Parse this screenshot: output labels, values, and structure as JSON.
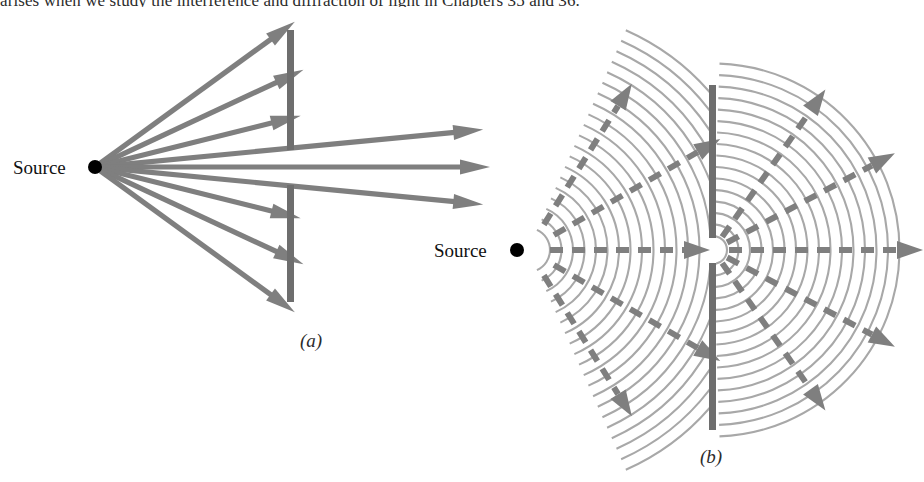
{
  "page": {
    "running_text": "arises when we study the interference and diffraction of light in Chapters 35 and 36.",
    "background_color": "#ffffff"
  },
  "colors": {
    "ray": "#7f7f7f",
    "barrier": "#6e6e6e",
    "wavefront": "#a8a8a8",
    "source_dot": "#000000",
    "text": "#111111",
    "caption": "#2b2b2b"
  },
  "figure": {
    "name": "huygens-ray-vs-wave-diffraction",
    "panels": [
      {
        "id": "a",
        "caption": "(a)",
        "caption_x": 300,
        "caption_y": 330,
        "model": "ray-model-straight-line-propagation",
        "source": {
          "label": "Source",
          "label_x": 13,
          "label_y": 157,
          "dot_x": 95,
          "dot_y": 167,
          "dot_r": 7
        },
        "barrier": {
          "x": 287,
          "width": 7,
          "upper_top": 30,
          "upper_bottom": 150,
          "lower_top": 185,
          "lower_bottom": 302,
          "slit_top": 150,
          "slit_bottom": 185
        },
        "rays": [
          {
            "name": "blocked-upper-1",
            "angle_deg": -36,
            "length": 247,
            "blocked": true
          },
          {
            "name": "blocked-upper-2",
            "angle_deg": -25,
            "length": 230,
            "blocked": true
          },
          {
            "name": "blocked-upper-3",
            "angle_deg": -14,
            "length": 212,
            "blocked": true
          },
          {
            "name": "through-slit-upper",
            "angle_deg": -5.5,
            "length": 390,
            "blocked": false
          },
          {
            "name": "through-slit-center",
            "angle_deg": 0,
            "length": 395,
            "blocked": false
          },
          {
            "name": "through-slit-lower",
            "angle_deg": 5.5,
            "length": 390,
            "blocked": false
          },
          {
            "name": "blocked-lower-1",
            "angle_deg": 14,
            "length": 212,
            "blocked": true
          },
          {
            "name": "blocked-lower-2",
            "angle_deg": 25,
            "length": 230,
            "blocked": true
          },
          {
            "name": "blocked-lower-3",
            "angle_deg": 36,
            "length": 247,
            "blocked": true
          }
        ]
      },
      {
        "id": "b",
        "caption": "(b)",
        "caption_x": 700,
        "caption_y": 446,
        "model": "wave-model-huygens-diffraction",
        "source": {
          "label": "Source",
          "label_x": 434,
          "label_y": 240,
          "dot_x": 517,
          "dot_y": 250,
          "dot_r": 7
        },
        "barrier": {
          "x": 709,
          "width": 7,
          "upper_top": 85,
          "upper_bottom": 238,
          "lower_top": 263,
          "lower_bottom": 430,
          "slit_top": 238,
          "slit_bottom": 263
        },
        "incident_waves": {
          "origin_x": 528,
          "origin_y": 250,
          "count": 20,
          "first_radius": 22,
          "spacing": 11.5,
          "half_angle_deg": 66
        },
        "diffracted_waves": {
          "origin_x": 713,
          "origin_y": 250,
          "count": 16,
          "first_radius": 14,
          "spacing": 11.5,
          "half_angle_deg": 88
        },
        "incident_rays": [
          {
            "name": "incident-ray-up-60",
            "angle_deg": -58,
            "start": 30,
            "end": 196
          },
          {
            "name": "incident-ray-up-30",
            "angle_deg": -30,
            "start": 30,
            "end": 222
          },
          {
            "name": "incident-ray-center",
            "angle_deg": 0,
            "start": 22,
            "end": 182
          },
          {
            "name": "incident-ray-down-30",
            "angle_deg": 30,
            "start": 30,
            "end": 222
          },
          {
            "name": "incident-ray-down-60",
            "angle_deg": 58,
            "start": 30,
            "end": 196
          }
        ],
        "diffracted_rays": [
          {
            "name": "diffracted-ray-up-55",
            "angle_deg": -55,
            "start": 16,
            "end": 196
          },
          {
            "name": "diffracted-ray-up-28",
            "angle_deg": -28,
            "start": 16,
            "end": 206
          },
          {
            "name": "diffracted-ray-center",
            "angle_deg": 0,
            "start": 16,
            "end": 210
          },
          {
            "name": "diffracted-ray-down-28",
            "angle_deg": 28,
            "start": 16,
            "end": 206
          },
          {
            "name": "diffracted-ray-down-55",
            "angle_deg": 55,
            "start": 16,
            "end": 196
          }
        ]
      }
    ]
  }
}
